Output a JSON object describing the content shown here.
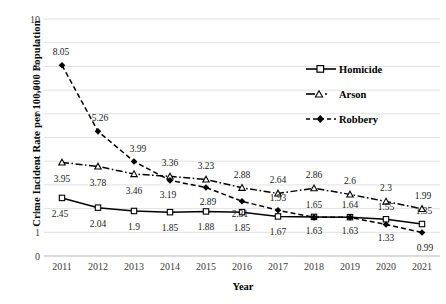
{
  "chart_data": {
    "type": "line",
    "title": "",
    "xlabel": "Year",
    "ylabel": "Crime Incident Rate per 100,000 Population",
    "categories": [
      "2011",
      "2012",
      "2013",
      "2014",
      "2015",
      "2016",
      "2017",
      "2018",
      "2019",
      "2020",
      "2021"
    ],
    "ylim": [
      0,
      10
    ],
    "y_ticks": [
      "0",
      "1",
      "2",
      "3",
      "4",
      "5",
      "6",
      "7",
      "8",
      "9",
      "10"
    ],
    "grid": true,
    "legend_position": "inside-upper-right",
    "series": [
      {
        "name": "Homicide",
        "marker": "square-open",
        "linestyle": "solid",
        "color": "#000000",
        "values": [
          2.45,
          2.04,
          1.9,
          1.85,
          1.88,
          1.85,
          1.67,
          1.65,
          1.64,
          1.55,
          1.35
        ],
        "labels": [
          "2.45",
          "2.04",
          "1.9",
          "1.85",
          "1.88",
          "1.85",
          "1.67",
          "1.65",
          "1.64",
          "1.55",
          "1.35"
        ]
      },
      {
        "name": "Arson",
        "marker": "triangle-open",
        "linestyle": "dashdot",
        "color": "#000000",
        "values": [
          3.95,
          3.78,
          3.46,
          3.36,
          3.23,
          2.88,
          2.64,
          2.86,
          2.6,
          2.3,
          1.99
        ],
        "labels": [
          "3.95",
          "3.78",
          "3.46",
          "3.36",
          "3.23",
          "2.88",
          "2.64",
          "2.86",
          "2.6",
          "2.3",
          "1.99"
        ]
      },
      {
        "name": "Robbery",
        "marker": "diamond-filled",
        "linestyle": "dashed",
        "color": "#000000",
        "values": [
          8.05,
          5.26,
          3.99,
          3.19,
          2.89,
          2.31,
          1.93,
          1.63,
          1.63,
          1.33,
          0.99
        ],
        "labels": [
          "8.05",
          "5.26",
          "3.99",
          "3.19",
          "2.89",
          "2.31",
          "1.93",
          "1.63",
          "1.63",
          "1.33",
          "0.99"
        ]
      }
    ]
  },
  "legend": {
    "items": [
      {
        "label": "Homicide"
      },
      {
        "label": "Arson"
      },
      {
        "label": "Robbery"
      }
    ]
  },
  "axis": {
    "x_title": "Year",
    "y_title": "Crime Incident Rate per 100,000 Population"
  }
}
